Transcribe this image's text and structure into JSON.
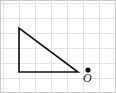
{
  "figure": {
    "width": 116,
    "height": 93,
    "background_color": "#ffffff",
    "border_color": "#c8c8c8",
    "grid": {
      "line_color": "#e2e2e2",
      "cell_width": 16,
      "cell_height": 15,
      "x_lines": [
        3,
        19,
        35,
        51,
        67,
        83,
        99,
        114
      ],
      "y_lines": [
        3,
        18,
        33,
        48,
        63,
        78,
        90
      ]
    },
    "shapes": {
      "triangle": {
        "name": "right-triangle",
        "stroke_color": "#111111",
        "stroke_width": 1.6,
        "fill": "none",
        "vertices": [
          {
            "label": "top-left",
            "x": 19,
            "y": 28
          },
          {
            "label": "bottom-left",
            "x": 19,
            "y": 72
          },
          {
            "label": "bottom-right",
            "x": 78,
            "y": 72
          }
        ]
      },
      "point": {
        "name": "origin-point",
        "x": 88,
        "y": 70,
        "radius": 2.6,
        "color": "#111111",
        "label": "O",
        "label_color": "#1a1a1a"
      }
    }
  }
}
